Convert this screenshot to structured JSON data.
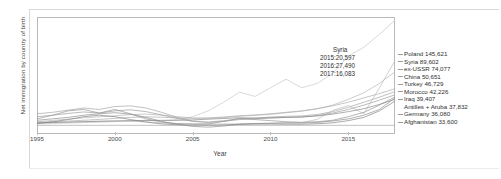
{
  "chart_data": {
    "type": "line",
    "title": "",
    "xlabel": "Year",
    "ylabel": "Net immigration by country of birth",
    "xlim": [
      1995,
      2018
    ],
    "ylim": [
      -12000,
      150000
    ],
    "xticks": [
      1995,
      2000,
      2005,
      2010,
      2015
    ],
    "grid": false,
    "legend_position": "right-direct-labels",
    "annotations": [
      {
        "title": "Syria",
        "lines": [
          "2015:20,597",
          "2016:27,490",
          "2017:16,083"
        ]
      }
    ],
    "series": [
      {
        "name": "Poland",
        "end_label": "Poland 145,621",
        "end_value": 145621,
        "color": "#c9c9c9",
        "x": [
          1995,
          1996,
          1997,
          1998,
          1999,
          2000,
          2001,
          2002,
          2003,
          2004,
          2005,
          2006,
          2007,
          2008,
          2009,
          2010,
          2011,
          2012,
          2013,
          2014,
          2015,
          2016,
          2017,
          2018
        ],
        "values": [
          2000,
          2600,
          3200,
          3800,
          4300,
          5200,
          6100,
          6800,
          7200,
          8000,
          12000,
          20000,
          32000,
          46000,
          40000,
          52000,
          64000,
          52000,
          58000,
          72000,
          96000,
          108000,
          126000,
          145621
        ]
      },
      {
        "name": "Syria",
        "end_label": "Syria 89,602",
        "end_value": 89602,
        "color": "#bdbdbd",
        "x": [
          1995,
          1996,
          1997,
          1998,
          1999,
          2000,
          2001,
          2002,
          2003,
          2004,
          2005,
          2006,
          2007,
          2008,
          2009,
          2010,
          2011,
          2012,
          2013,
          2014,
          2015,
          2016,
          2017,
          2018
        ],
        "values": [
          3000,
          3400,
          4200,
          5200,
          5800,
          6200,
          5600,
          4800,
          3400,
          2200,
          1800,
          1700,
          1900,
          2100,
          2300,
          2600,
          3000,
          3800,
          8200,
          20597,
          27490,
          16083,
          52000,
          89602
        ]
      },
      {
        "name": "ex-USSR",
        "end_label": "ex-USSR 74,077",
        "end_value": 74077,
        "color": "#b4b4b4",
        "x": [
          1995,
          1996,
          1997,
          1998,
          1999,
          2000,
          2001,
          2002,
          2003,
          2004,
          2005,
          2006,
          2007,
          2008,
          2009,
          2010,
          2011,
          2012,
          2013,
          2014,
          2015,
          2016,
          2017,
          2018
        ],
        "values": [
          5000,
          6800,
          8600,
          10400,
          11800,
          13200,
          14800,
          15600,
          14200,
          12000,
          10200,
          9800,
          10800,
          12600,
          13800,
          15200,
          17400,
          19600,
          23000,
          28000,
          36000,
          45000,
          58000,
          74077
        ]
      },
      {
        "name": "China",
        "end_label": "China 50,651",
        "end_value": 50651,
        "color": "#adadad",
        "x": [
          1995,
          1996,
          1997,
          1998,
          1999,
          2000,
          2001,
          2002,
          2003,
          2004,
          2005,
          2006,
          2007,
          2008,
          2009,
          2010,
          2011,
          2012,
          2013,
          2014,
          2015,
          2016,
          2017,
          2018
        ],
        "values": [
          4200,
          5000,
          6000,
          7000,
          8200,
          9600,
          11000,
          11800,
          11200,
          10200,
          9600,
          10200,
          11600,
          13200,
          14400,
          16000,
          18000,
          20000,
          23000,
          27000,
          32000,
          38000,
          44000,
          50651
        ]
      },
      {
        "name": "Turkey",
        "end_label": "Turkey 46,729",
        "end_value": 46729,
        "color": "#a6a6a6",
        "x": [
          1995,
          1996,
          1997,
          1998,
          1999,
          2000,
          2001,
          2002,
          2003,
          2004,
          2005,
          2006,
          2007,
          2008,
          2009,
          2010,
          2011,
          2012,
          2013,
          2014,
          2015,
          2016,
          2017,
          2018
        ],
        "values": [
          16000,
          18000,
          21000,
          24000,
          22000,
          26000,
          27000,
          24000,
          18000,
          11000,
          6000,
          4500,
          6500,
          9000,
          10000,
          11500,
          12500,
          13000,
          15000,
          19000,
          25000,
          32000,
          39000,
          46729
        ]
      },
      {
        "name": "Morocco",
        "end_label": "Morocco 42,226",
        "end_value": 42226,
        "color": "#9e9e9e",
        "x": [
          1995,
          1996,
          1997,
          1998,
          1999,
          2000,
          2001,
          2002,
          2003,
          2004,
          2005,
          2006,
          2007,
          2008,
          2009,
          2010,
          2011,
          2012,
          2013,
          2014,
          2015,
          2016,
          2017,
          2018
        ],
        "values": [
          12000,
          14000,
          16500,
          18500,
          17000,
          20000,
          21500,
          19000,
          14500,
          9500,
          5500,
          4000,
          5500,
          8000,
          9000,
          10000,
          11000,
          11500,
          13500,
          17000,
          22000,
          28000,
          35000,
          42226
        ]
      },
      {
        "name": "Iraq",
        "end_label": "Iraq 39,407",
        "end_value": 39407,
        "color": "#979797",
        "x": [
          1995,
          1996,
          1997,
          1998,
          1999,
          2000,
          2001,
          2002,
          2003,
          2004,
          2005,
          2006,
          2007,
          2008,
          2009,
          2010,
          2011,
          2012,
          2013,
          2014,
          2015,
          2016,
          2017,
          2018
        ],
        "values": [
          9000,
          14000,
          20000,
          22000,
          17000,
          22000,
          16000,
          9000,
          4500,
          2500,
          1800,
          2000,
          5500,
          9500,
          8000,
          6500,
          5000,
          4200,
          5000,
          7000,
          12000,
          18000,
          28000,
          39407
        ]
      },
      {
        "name": "Antilles + Aruba",
        "end_label": "Antilles + Aruba 37,832",
        "end_value": 37832,
        "color": "#8f8f8f",
        "x": [
          1995,
          1996,
          1997,
          1998,
          1999,
          2000,
          2001,
          2002,
          2003,
          2004,
          2005,
          2006,
          2007,
          2008,
          2009,
          2010,
          2011,
          2012,
          2013,
          2014,
          2015,
          2016,
          2017,
          2018
        ],
        "values": [
          7000,
          9000,
          11000,
          14000,
          16000,
          17500,
          15500,
          11000,
          5500,
          1500,
          -1500,
          -2500,
          -1000,
          1500,
          2500,
          3000,
          3500,
          3200,
          4000,
          6000,
          9000,
          14000,
          22000,
          37832
        ]
      },
      {
        "name": "Germany",
        "end_label": "Germany 36,080",
        "end_value": 36080,
        "color": "#8a8a8a",
        "x": [
          1995,
          1996,
          1997,
          1998,
          1999,
          2000,
          2001,
          2002,
          2003,
          2004,
          2005,
          2006,
          2007,
          2008,
          2009,
          2010,
          2011,
          2012,
          2013,
          2014,
          2015,
          2016,
          2017,
          2018
        ],
        "values": [
          3500,
          4000,
          4500,
          5000,
          5500,
          6000,
          6500,
          6800,
          6500,
          6800,
          7500,
          8500,
          9500,
          10500,
          10000,
          10500,
          11000,
          11500,
          13000,
          15500,
          19000,
          23000,
          29000,
          36080
        ]
      },
      {
        "name": "Afghanistan",
        "end_label": "Afghanistan 33,600",
        "end_value": 33600,
        "color": "#848484",
        "x": [
          1995,
          1996,
          1997,
          1998,
          1999,
          2000,
          2001,
          2002,
          2003,
          2004,
          2005,
          2006,
          2007,
          2008,
          2009,
          2010,
          2011,
          2012,
          2013,
          2014,
          2015,
          2016,
          2017,
          2018
        ],
        "values": [
          2500,
          5000,
          8000,
          12000,
          14000,
          12000,
          8000,
          4500,
          2000,
          800,
          300,
          200,
          600,
          1500,
          1800,
          1800,
          1600,
          1500,
          2200,
          3500,
          6500,
          11000,
          20000,
          33600
        ]
      }
    ]
  },
  "axis": {
    "xlabel": "Year",
    "ylabel": "Net immigration by country of birth",
    "xtick_labels": [
      "1995",
      "2000",
      "2005",
      "2010",
      "2015"
    ]
  },
  "annotation": {
    "title": "Syria",
    "line1": "2015:20,597",
    "line2": "2016:27,490",
    "line3": "2017:16,083"
  },
  "legend": {
    "items": [
      {
        "label": "Poland 145,621",
        "indent": false
      },
      {
        "label": "Syria 89,602",
        "indent": false
      },
      {
        "label": "ex-USSR 74,077",
        "indent": false
      },
      {
        "label": "China 50,651",
        "indent": false
      },
      {
        "label": "Turkey 46,729",
        "indent": false
      },
      {
        "label": "Morocco 42,226",
        "indent": false
      },
      {
        "label": "Iraq 39,407",
        "indent": false
      },
      {
        "label": "Antilles + Aruba 37,832",
        "indent": true
      },
      {
        "label": "Germany 36,080",
        "indent": false
      },
      {
        "label": "Afghanistan 33,600",
        "indent": false
      }
    ]
  },
  "colors": {
    "background": "#ffffff",
    "frame": "#b9b9b9",
    "text": "#2f2f2f",
    "line_light": "#c9c9c9",
    "line_dark": "#848484"
  }
}
